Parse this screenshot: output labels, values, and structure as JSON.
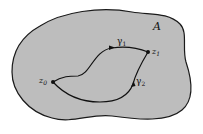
{
  "diagram": {
    "region": {
      "label": "A",
      "fill": "#bdbdbd",
      "stroke": "#1a1a1a"
    },
    "points": [
      {
        "id": "z0",
        "label": "z",
        "subscript": "0"
      },
      {
        "id": "z1",
        "label": "z",
        "subscript": "1"
      }
    ],
    "paths": [
      {
        "id": "gamma1",
        "label": "γ",
        "subscript": "1",
        "from": "z0",
        "to": "z1"
      },
      {
        "id": "gamma2",
        "label": "γ",
        "subscript": "2",
        "from": "z0",
        "to": "z1"
      }
    ]
  }
}
